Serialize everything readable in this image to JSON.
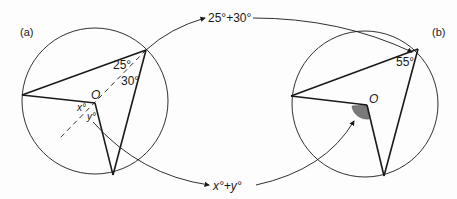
{
  "panel_a": {
    "label": "(a)",
    "center_label": "O",
    "angle_top_left": "25°",
    "angle_top_right": "30°",
    "angle_x": "x°",
    "angle_y": "y°"
  },
  "panel_b": {
    "label": "(b)",
    "center_label": "O",
    "angle_top": "55°"
  },
  "connectors": {
    "top_sum": "25°+30°",
    "bottom_sum": "x°+y°"
  },
  "colors": {
    "line": "#1a1a1a",
    "shaded_angle": "#7a7a7a"
  }
}
